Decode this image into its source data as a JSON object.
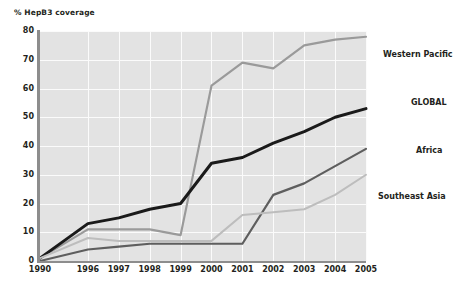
{
  "chart_data": {
    "type": "line",
    "title": "% HepB3 coverage",
    "xlabel": "",
    "ylabel": "% HepB3 coverage",
    "ylim": [
      0,
      80
    ],
    "yticks": [
      0,
      10,
      20,
      30,
      40,
      50,
      60,
      70,
      80
    ],
    "grid": true,
    "legend_position": "right-inline-labels",
    "categories": [
      "1990",
      "1996",
      "1997",
      "1998",
      "1999",
      "2000",
      "2001",
      "2002",
      "2003",
      "2004",
      "2005"
    ],
    "series": [
      {
        "name": "Western Pacific",
        "color": "#9a9a9a",
        "values": [
          1,
          11,
          11,
          11,
          9,
          61,
          69,
          67,
          75,
          77,
          78
        ]
      },
      {
        "name": "GLOBAL",
        "color": "#1a1a1a",
        "values": [
          1,
          13,
          15,
          18,
          20,
          34,
          36,
          41,
          45,
          50,
          53
        ]
      },
      {
        "name": "Africa",
        "color": "#5e5e5e",
        "values": [
          0,
          4,
          5,
          6,
          6,
          6,
          6,
          23,
          27,
          33,
          39
        ]
      },
      {
        "name": "Southeast Asia",
        "color": "#bdbdbd",
        "values": [
          1,
          8,
          7,
          7,
          7,
          7,
          16,
          17,
          18,
          23,
          30
        ]
      }
    ],
    "annotations": [
      {
        "text": "Western Pacific",
        "series": "Western Pacific",
        "x": 383,
        "y": 51,
        "weight": "bold"
      },
      {
        "text": "GLOBAL",
        "series": "GLOBAL",
        "x": 411,
        "y": 99,
        "weight": "bold"
      },
      {
        "text": "Africa",
        "series": "Africa",
        "x": 416,
        "y": 147,
        "weight": "bold"
      },
      {
        "text": "Southeast Asia",
        "series": "Southeast Asia",
        "x": 378,
        "y": 193,
        "weight": "bold"
      }
    ],
    "colors": {
      "plot_background": "#e3e3e3",
      "gridline": "#fbfbfb",
      "axis": "#8d8d8d",
      "text": "#231f20",
      "page_background": "#ffffff"
    }
  }
}
